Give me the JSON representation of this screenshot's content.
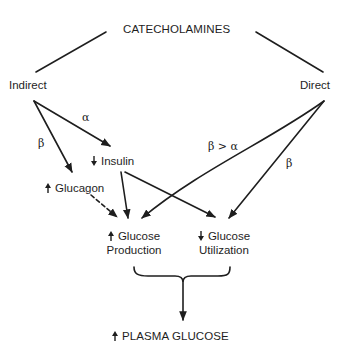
{
  "diagram": {
    "root": "CATECHOLAMINES",
    "branches": {
      "indirect": "Indirect",
      "direct": "Direct"
    },
    "edge_labels": {
      "indirect_to_insulin": "α",
      "indirect_to_glucagon": "β",
      "direct_to_production": "β > α",
      "direct_to_utilization": "β"
    },
    "nodes": {
      "insulin": {
        "label": "Insulin",
        "direction": "down"
      },
      "glucagon": {
        "label": "Glucagon",
        "direction": "up"
      },
      "glucose_production": {
        "line1": "Glucose",
        "line2": "Production",
        "direction": "up"
      },
      "glucose_utilization": {
        "line1": "Glucose",
        "line2": "Utilization",
        "direction": "down"
      },
      "plasma_glucose": {
        "label": "PLASMA GLUCOSE",
        "direction": "up"
      }
    },
    "edges": [
      {
        "from": "CATECHOLAMINES",
        "to": "Indirect",
        "style": "solid"
      },
      {
        "from": "CATECHOLAMINES",
        "to": "Direct",
        "style": "solid"
      },
      {
        "from": "Indirect",
        "to": "Insulin",
        "label": "α",
        "style": "arrow"
      },
      {
        "from": "Indirect",
        "to": "Glucagon",
        "label": "β",
        "style": "arrow"
      },
      {
        "from": "Direct",
        "to": "Glucose Production",
        "label": "β > α",
        "style": "arrow"
      },
      {
        "from": "Direct",
        "to": "Glucose Utilization",
        "label": "β",
        "style": "arrow"
      },
      {
        "from": "Insulin",
        "to": "Glucose Production",
        "style": "arrow"
      },
      {
        "from": "Insulin",
        "to": "Glucose Utilization",
        "style": "arrow"
      },
      {
        "from": "Glucagon",
        "to": "Glucose Production",
        "style": "dashed-arrow"
      },
      {
        "from": "Glucose Production + Glucose Utilization",
        "to": "PLASMA GLUCOSE",
        "style": "brace-arrow"
      }
    ],
    "colors": {
      "ink": "#1e1e1e",
      "background": "#ffffff"
    }
  }
}
